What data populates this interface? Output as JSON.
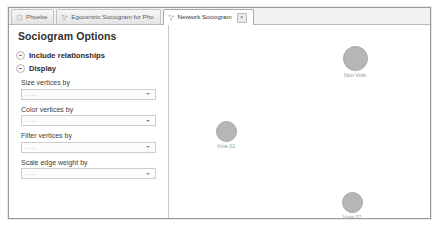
{
  "window": {
    "tabs": [
      {
        "label": "Phoebe",
        "icon": "circle-icon",
        "active": false,
        "closable": false
      },
      {
        "label": "Egocentric Sociogram for Pho",
        "icon": "network-icon",
        "active": false,
        "closable": false
      },
      {
        "label": "Network Sociogram",
        "icon": "network-icon",
        "active": true,
        "closable": true,
        "close_label": "×"
      }
    ]
  },
  "sidebar": {
    "panel_title": "Sociogram Options",
    "sections": [
      {
        "label": "Include relationships",
        "expanded": false
      },
      {
        "label": "Display",
        "expanded": true
      }
    ],
    "fields": [
      {
        "label": "Size vertices by",
        "value": "....",
        "placeholder": "...."
      },
      {
        "label": "Color vertices by",
        "value": "....",
        "placeholder": "...."
      },
      {
        "label": "Filter vertices by",
        "value": "....",
        "placeholder": "...."
      },
      {
        "label": "Scale edge weight by",
        "value": "....",
        "placeholder": "...."
      }
    ]
  },
  "canvas": {
    "nodes": [
      {
        "label": "Non Vote",
        "x": 186,
        "y": 21,
        "size": 25,
        "color": "#b6b6b6"
      },
      {
        "label": "Vote 01",
        "x": 57,
        "y": 96,
        "size": 21,
        "color": "#b6b6b6"
      },
      {
        "label": "Vote 02",
        "x": 183,
        "y": 167,
        "size": 21,
        "color": "#b6b6b6"
      }
    ]
  }
}
